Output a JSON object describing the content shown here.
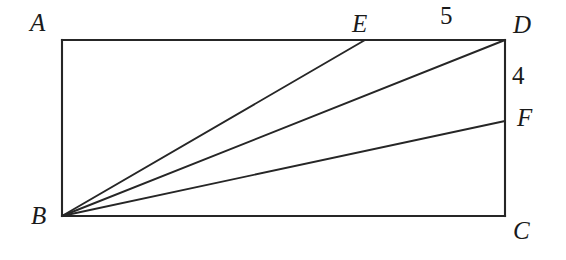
{
  "figure": {
    "kind": "plane-geometry-diagram",
    "stroke_color": "#262626",
    "background_color": "#ffffff",
    "rectangle": {
      "name": "ABCD",
      "corners": {
        "A": {
          "label": "A",
          "x": 62,
          "y": 40
        },
        "B": {
          "label": "B",
          "x": 62,
          "y": 216
        },
        "C": {
          "label": "C",
          "x": 505,
          "y": 216
        },
        "D": {
          "label": "D",
          "x": 505,
          "y": 40
        }
      }
    },
    "points": {
      "E": {
        "label": "E",
        "x": 365,
        "y": 40,
        "on": "AD"
      },
      "F": {
        "label": "F",
        "x": 505,
        "y": 121,
        "on": "DC"
      }
    },
    "segments": [
      {
        "name": "AD",
        "from": "A",
        "to": "D"
      },
      {
        "name": "DC",
        "from": "D",
        "to": "C"
      },
      {
        "name": "CB",
        "from": "C",
        "to": "B"
      },
      {
        "name": "BA",
        "from": "B",
        "to": "A"
      },
      {
        "name": "BE",
        "from": "B",
        "to": "E"
      },
      {
        "name": "BD",
        "from": "B",
        "to": "D"
      },
      {
        "name": "BF",
        "from": "B",
        "to": "F"
      }
    ],
    "measures": {
      "top_segment_ED": "5",
      "right_segment_DF": "4"
    }
  }
}
